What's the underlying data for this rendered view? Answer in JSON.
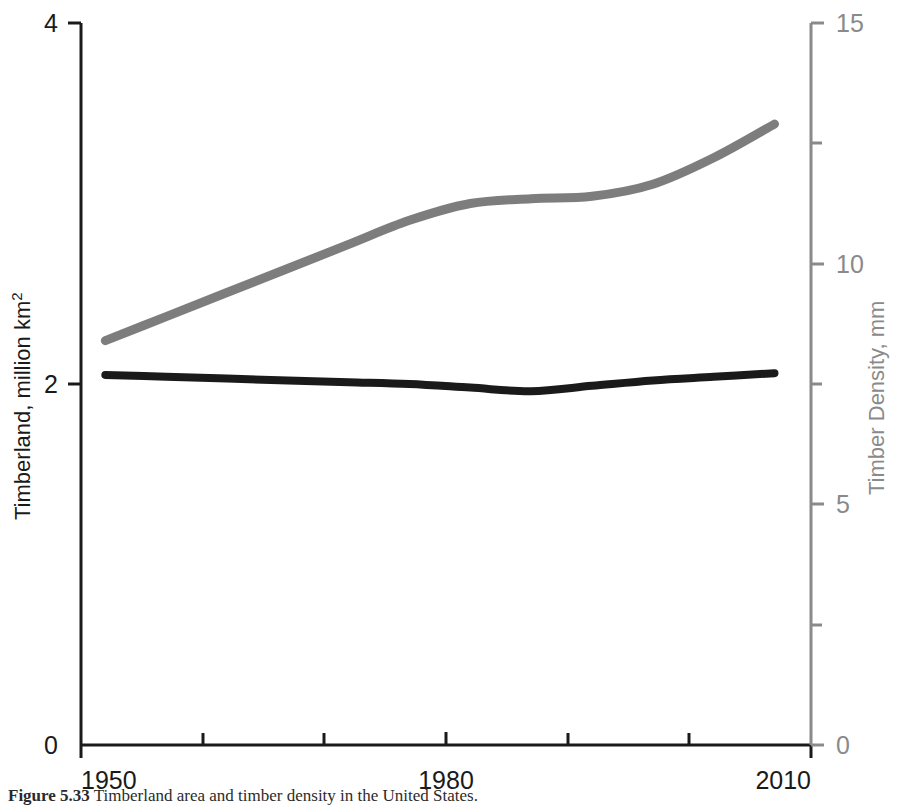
{
  "chart_data": {
    "type": "line",
    "title": "",
    "subtitle": "",
    "xlabel": "",
    "ylabel": "Timberland, million km",
    "ylabel_sup": "2",
    "ylabel_full": "Timberland, million km2",
    "y2label": "Timber Density, mm",
    "grid": false,
    "legend_position": "none",
    "xlim": [
      1950,
      2010
    ],
    "ylim": [
      0,
      4
    ],
    "y2lim": [
      0,
      15
    ],
    "x_ticks_major": [
      1950,
      1980,
      2010
    ],
    "x_tick_labels": [
      "1950",
      "1980",
      "2010"
    ],
    "x_ticks_minor": [
      1960,
      1970,
      1990,
      2000
    ],
    "y_ticks_major": [
      0,
      2,
      4
    ],
    "y_tick_labels": [
      "0",
      "2",
      "4"
    ],
    "y2_ticks_major": [
      0,
      5,
      10,
      15
    ],
    "y2_tick_labels": [
      "0",
      "5",
      "10",
      "15"
    ],
    "y2_ticks_minor": [
      2.5,
      7.5,
      12.5
    ],
    "series": [
      {
        "name": "Timberland, million km2",
        "axis": "left",
        "color": "#1a1a1a",
        "x": [
          1952,
          1957,
          1962,
          1967,
          1972,
          1977,
          1982,
          1987,
          1992,
          1997,
          2002,
          2007
        ],
        "values": [
          2.05,
          2.04,
          2.03,
          2.02,
          2.01,
          2.0,
          1.98,
          1.96,
          1.99,
          2.02,
          2.04,
          2.06
        ]
      },
      {
        "name": "Timber Density, mm",
        "axis": "right",
        "color": "#7d7d7d",
        "x": [
          1952,
          1957,
          1962,
          1967,
          1972,
          1977,
          1982,
          1987,
          1992,
          1997,
          2002,
          2007
        ],
        "values": [
          8.4,
          8.9,
          9.4,
          9.9,
          10.4,
          10.9,
          11.25,
          11.35,
          11.4,
          11.65,
          12.2,
          12.9
        ]
      }
    ],
    "annotations": []
  },
  "caption": {
    "label": "Figure 5.33",
    "text": "Timberland area and timber density in the United States."
  }
}
